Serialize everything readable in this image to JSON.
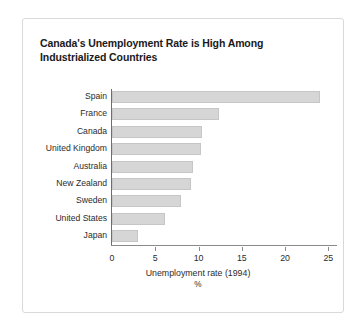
{
  "figure": {
    "title": "Canada's Unemployment Rate is High Among Industrialized Countries",
    "frame_border_color": "#d9d9d9",
    "background_color": "#ffffff"
  },
  "chart_data": {
    "type": "bar",
    "orientation": "horizontal",
    "title": "Canada's Unemployment Rate is High Among Industrialized Countries",
    "categories": [
      "Spain",
      "France",
      "Canada",
      "United Kingdom",
      "Australia",
      "New Zealand",
      "Sweden",
      "United States",
      "Japan"
    ],
    "values": [
      24.0,
      12.4,
      10.4,
      10.3,
      9.4,
      9.1,
      8.0,
      6.1,
      3.0
    ],
    "xlabel": "Unemployment rate (1994)",
    "xunit": "%",
    "ylabel": "",
    "xlim": [
      0,
      26
    ],
    "xticks": [
      0,
      5,
      10,
      15,
      20,
      25
    ],
    "xtick_labels": [
      "0",
      "5",
      "10",
      "15",
      "20",
      "25"
    ],
    "grid": false,
    "legend": false,
    "bar_color": "#d6d6d6",
    "bar_edge_color": "#c6c6c6",
    "axis_color": "#6e6e6e"
  }
}
